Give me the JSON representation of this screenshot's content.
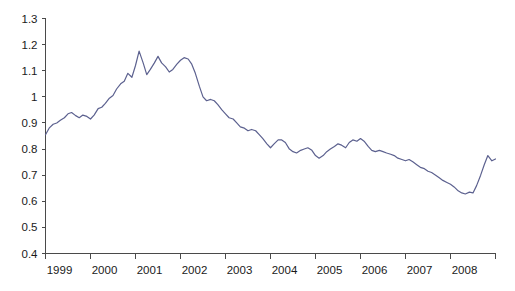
{
  "chart_data": {
    "type": "line",
    "title": "",
    "subtitle": "",
    "xlabel": "",
    "ylabel": "",
    "legend": [],
    "legend_position": "none",
    "grid": false,
    "line_color": "#5c618f",
    "axis_color": "#4a4a4a",
    "background_color": "#ffffff",
    "xlim": [
      1999.0,
      2009.0
    ],
    "ylim": [
      0.4,
      1.3
    ],
    "y_ticks": [
      0.4,
      0.5,
      0.6,
      0.7,
      0.8,
      0.9,
      1.0,
      1.1,
      1.2,
      1.3
    ],
    "y_tick_labels": [
      "0.4",
      "0.5",
      "0.6",
      "0.7",
      "0.8",
      "0.9",
      "1",
      "1.1",
      "1.2",
      "1.3"
    ],
    "x_ticks": [
      1999,
      2000,
      2001,
      2002,
      2003,
      2004,
      2005,
      2006,
      2007,
      2008,
      2009
    ],
    "x_tick_labels": [
      "1999",
      "2000",
      "2001",
      "2002",
      "2003",
      "2004",
      "2005",
      "2006",
      "2007",
      "2008",
      ""
    ],
    "series": [
      {
        "name": "series-1",
        "x": [
          1999.0,
          1999.08,
          1999.17,
          1999.25,
          1999.33,
          1999.42,
          1999.5,
          1999.58,
          1999.67,
          1999.75,
          1999.83,
          1999.92,
          2000.0,
          2000.08,
          2000.17,
          2000.25,
          2000.33,
          2000.42,
          2000.5,
          2000.58,
          2000.67,
          2000.75,
          2000.83,
          2000.92,
          2001.0,
          2001.08,
          2001.17,
          2001.25,
          2001.33,
          2001.42,
          2001.5,
          2001.58,
          2001.67,
          2001.75,
          2001.83,
          2001.92,
          2002.0,
          2002.08,
          2002.17,
          2002.25,
          2002.33,
          2002.42,
          2002.5,
          2002.58,
          2002.67,
          2002.75,
          2002.83,
          2002.92,
          2003.0,
          2003.08,
          2003.17,
          2003.25,
          2003.33,
          2003.42,
          2003.5,
          2003.58,
          2003.67,
          2003.75,
          2003.83,
          2003.92,
          2004.0,
          2004.08,
          2004.17,
          2004.25,
          2004.33,
          2004.42,
          2004.5,
          2004.58,
          2004.67,
          2004.75,
          2004.83,
          2004.92,
          2005.0,
          2005.08,
          2005.17,
          2005.25,
          2005.33,
          2005.42,
          2005.5,
          2005.58,
          2005.67,
          2005.75,
          2005.83,
          2005.92,
          2006.0,
          2006.08,
          2006.17,
          2006.25,
          2006.33,
          2006.42,
          2006.5,
          2006.58,
          2006.67,
          2006.75,
          2006.83,
          2006.92,
          2007.0,
          2007.08,
          2007.17,
          2007.25,
          2007.33,
          2007.42,
          2007.5,
          2007.58,
          2007.67,
          2007.75,
          2007.83,
          2007.92,
          2008.0,
          2008.08,
          2008.17,
          2008.25,
          2008.33,
          2008.42,
          2008.5,
          2008.58,
          2008.67,
          2008.75,
          2008.83,
          2008.92,
          2009.0
        ],
        "values": [
          0.855,
          0.88,
          0.895,
          0.9,
          0.91,
          0.92,
          0.935,
          0.94,
          0.928,
          0.92,
          0.93,
          0.925,
          0.915,
          0.93,
          0.955,
          0.96,
          0.975,
          0.995,
          1.005,
          1.03,
          1.05,
          1.06,
          1.09,
          1.075,
          1.12,
          1.175,
          1.13,
          1.085,
          1.105,
          1.13,
          1.155,
          1.13,
          1.115,
          1.095,
          1.105,
          1.125,
          1.14,
          1.15,
          1.145,
          1.125,
          1.09,
          1.04,
          1.0,
          0.985,
          0.99,
          0.985,
          0.97,
          0.95,
          0.935,
          0.92,
          0.915,
          0.9,
          0.885,
          0.88,
          0.87,
          0.875,
          0.87,
          0.855,
          0.84,
          0.82,
          0.805,
          0.82,
          0.835,
          0.835,
          0.825,
          0.8,
          0.79,
          0.785,
          0.795,
          0.8,
          0.805,
          0.795,
          0.775,
          0.765,
          0.775,
          0.79,
          0.8,
          0.81,
          0.82,
          0.815,
          0.805,
          0.825,
          0.835,
          0.83,
          0.84,
          0.83,
          0.81,
          0.795,
          0.79,
          0.795,
          0.79,
          0.785,
          0.78,
          0.775,
          0.765,
          0.76,
          0.755,
          0.76,
          0.75,
          0.74,
          0.73,
          0.725,
          0.715,
          0.71,
          0.7,
          0.69,
          0.68,
          0.672,
          0.665,
          0.655,
          0.64,
          0.632,
          0.628,
          0.635,
          0.632,
          0.66,
          0.7,
          0.74,
          0.775,
          0.755,
          0.762
        ]
      }
    ]
  }
}
